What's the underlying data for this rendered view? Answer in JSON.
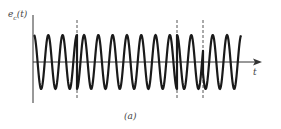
{
  "figure": {
    "y_label": {
      "base": "e",
      "sub": "c",
      "arg": "(t)"
    },
    "x_label": "t",
    "caption": "(a)",
    "colors": {
      "wave": "#1a1a1a",
      "axis": "#333333",
      "dashed": "#555555",
      "background": "#ffffff"
    }
  },
  "geometry": {
    "axis_x": 33,
    "axis_top": 15,
    "axis_bottom": 103,
    "baseline_y": 62,
    "arrow_end_x": 262,
    "amplitude": 27,
    "period_px": 14.3,
    "wave_start_x": 34,
    "wave_end_x": 241,
    "segments": [
      {
        "x_start": 34,
        "x_end": 77,
        "phase_deg": 0
      },
      {
        "x_start": 77,
        "x_end": 177,
        "phase_deg": 180
      },
      {
        "x_start": 177,
        "x_end": 203,
        "phase_deg": 0
      },
      {
        "x_start": 203,
        "x_end": 241,
        "phase_deg": 180
      }
    ],
    "dashed_lines_x": [
      77,
      177,
      203
    ],
    "dashed_top": 20,
    "dashed_bottom": 99
  }
}
